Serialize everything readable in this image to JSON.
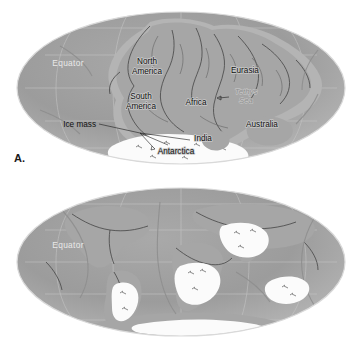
{
  "figure": {
    "type": "two-panel world map figure",
    "background_color": "#ffffff",
    "projection": "Mollweide oval world projection",
    "ocean_color": "#9a9a9a",
    "land_color": "#a6a6a6",
    "ice_color": "#fbfbfb",
    "graticule_color": "#c8c8c8",
    "label_color": "#111111"
  },
  "panels": [
    {
      "letter": "A.",
      "name": "pangaea-map",
      "equator_label": "Equator",
      "labels": [
        {
          "text": "North\nAmerica",
          "line1": "North",
          "line2": "America",
          "name": "north-america"
        },
        {
          "text": "South\nAmerica",
          "line1": "South",
          "line2": "America",
          "name": "south-america"
        },
        {
          "text": "Africa",
          "line1": "Africa",
          "line2": "",
          "name": "africa"
        },
        {
          "text": "Eurasia",
          "line1": "Eurasia",
          "line2": "",
          "name": "eurasia"
        },
        {
          "text": "Australia",
          "line1": "Australia",
          "line2": "",
          "name": "australia"
        },
        {
          "text": "India",
          "line1": "India",
          "line2": "",
          "name": "india"
        },
        {
          "text": "Antarctica",
          "line1": "Antarctica",
          "line2": "",
          "name": "antarctica"
        }
      ],
      "sea_label": {
        "line1": "Tethys",
        "line2": "Sea",
        "name": "tethys-sea"
      },
      "callout": {
        "text": "Ice mass",
        "name": "ice-mass-callout"
      }
    },
    {
      "letter": "B.",
      "name": "modern-continents-map",
      "equator_label": "Equator",
      "labels": [],
      "ice_patches_count": 5
    }
  ]
}
